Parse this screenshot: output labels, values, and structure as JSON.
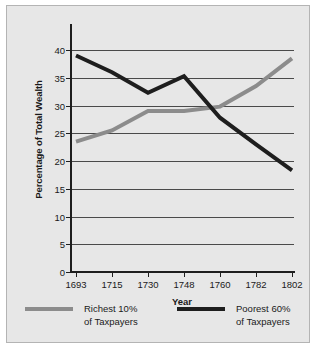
{
  "chart_data": {
    "type": "line",
    "title": "",
    "xlabel": "Year",
    "ylabel": "Percentage of Total Wealth",
    "categories": [
      "1693",
      "1715",
      "1730",
      "1748",
      "1760",
      "1782",
      "1802"
    ],
    "x_is_categorical": true,
    "ylim": [
      0,
      40
    ],
    "ytick_step": 5,
    "yticks": [
      "0",
      "5",
      "10",
      "15",
      "20",
      "25",
      "30",
      "35",
      "40"
    ],
    "grid": "horizontal",
    "legend_position": "below-axes",
    "series": [
      {
        "name": "Richest 10%\nof Taxpayers",
        "name_line1": "Richest 10%",
        "name_line2": "of Taxpayers",
        "color": "#8c8c8c",
        "values": [
          23.5,
          25.5,
          29.0,
          29.0,
          29.8,
          33.5,
          38.5
        ]
      },
      {
        "name": "Poorest 60%\nof Taxpayers",
        "name_line1": "Poorest 60%",
        "name_line2": "of Taxpayers",
        "color": "#1e1e1e",
        "values": [
          39.0,
          36.0,
          32.3,
          35.3,
          27.8,
          23.0,
          18.3
        ]
      }
    ]
  },
  "figure": {
    "background_color": "#e7e7e7",
    "border_color": "#b4b4b4",
    "gridline_color": "#4a4a4a",
    "axis_color": "#1e1e1e",
    "text_color": "#1a1a1a"
  }
}
